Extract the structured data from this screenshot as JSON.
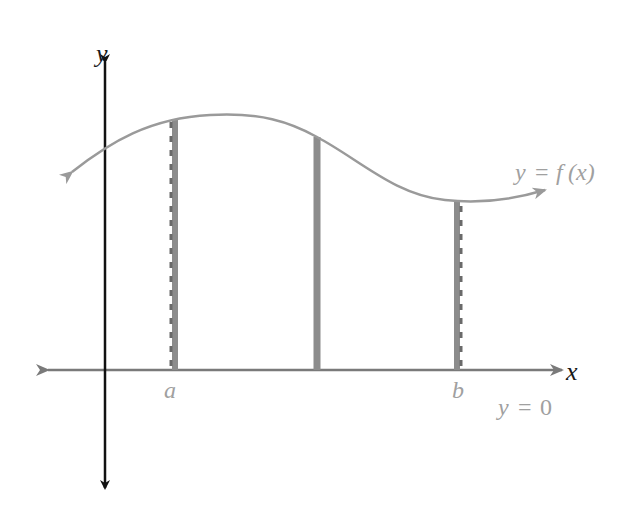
{
  "figure": {
    "axes": {
      "x_label": "x",
      "y_label": "y",
      "x_axis_equation_prefix": "y",
      "x_axis_equation_eq": "=",
      "x_axis_equation_value": "0"
    },
    "curve": {
      "label_prefix": "y",
      "label_eq": "=",
      "label_func": "f",
      "label_arg": "(x)"
    },
    "markers": {
      "left": "a",
      "right": "b"
    },
    "colors": {
      "axis_dark": "#111111",
      "axis_gray": "#7a7a7a",
      "curve": "#9a9a9a",
      "bars": "#8c8c8c",
      "dashes": "#6a6a6a",
      "labels_gray": "#a0a0a0",
      "labels_dark": "#1a1a1a"
    }
  }
}
